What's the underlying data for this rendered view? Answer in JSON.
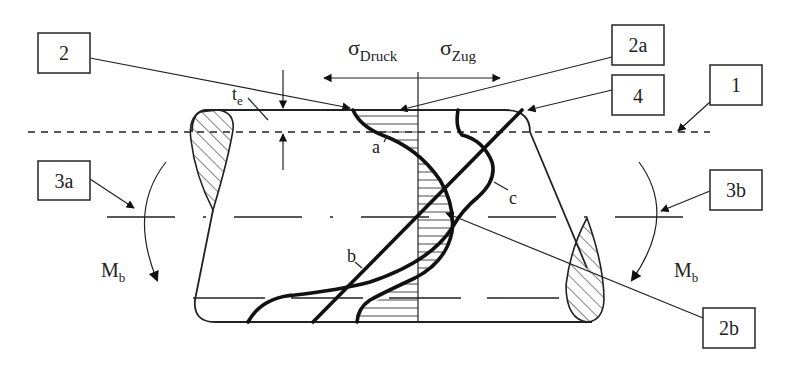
{
  "figure": {
    "type": "stress-distribution diagram of a surface-hardened shaft under bending",
    "axis_labels": {
      "compression_symbol": "σ",
      "compression_subscript": "Druck",
      "tension_symbol": "σ",
      "tension_subscript": "Zug"
    },
    "dimension": {
      "symbol": "t",
      "subscript": "e"
    },
    "moments": {
      "left": {
        "symbol": "M",
        "subscript": "b"
      },
      "right": {
        "symbol": "M",
        "subscript": "b"
      }
    },
    "curve_labels": {
      "a": "a",
      "b": "b",
      "c": "c"
    },
    "callouts": [
      {
        "id": "2",
        "label": "2"
      },
      {
        "id": "2a",
        "label": "2a"
      },
      {
        "id": "4",
        "label": "4"
      },
      {
        "id": "1",
        "label": "1"
      },
      {
        "id": "3a",
        "label": "3a"
      },
      {
        "id": "3b",
        "label": "3b"
      },
      {
        "id": "2b",
        "label": "2b"
      }
    ]
  }
}
